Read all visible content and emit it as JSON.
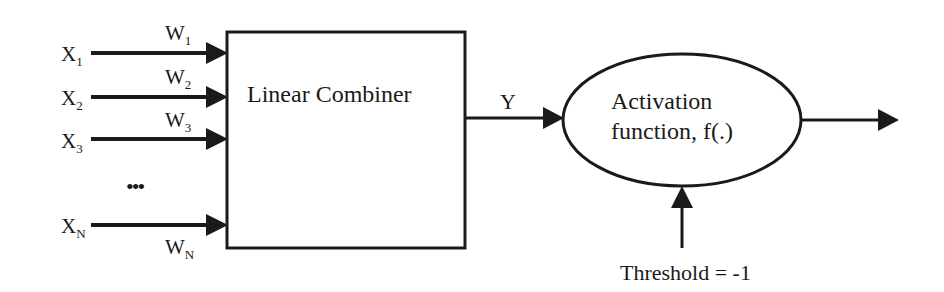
{
  "diagram": {
    "type": "perceptron-block-diagram",
    "inputs": [
      {
        "label": "X",
        "sub": "1",
        "weight": "W",
        "weight_sub": "1"
      },
      {
        "label": "X",
        "sub": "2",
        "weight": "W",
        "weight_sub": "2"
      },
      {
        "label": "X",
        "sub": "3",
        "weight": "W",
        "weight_sub": "3"
      },
      {
        "label": "X",
        "sub": "N",
        "weight": "W",
        "weight_sub": "N"
      }
    ],
    "ellipsis": "•••",
    "combiner": {
      "label": "Linear Combiner"
    },
    "output_signal": {
      "label": "Y"
    },
    "activation": {
      "line1": "Activation",
      "line2": "function, f(.)"
    },
    "threshold": {
      "label": "Threshold = -1"
    },
    "colors": {
      "stroke": "#1a1a1a",
      "background": "#ffffff"
    }
  }
}
